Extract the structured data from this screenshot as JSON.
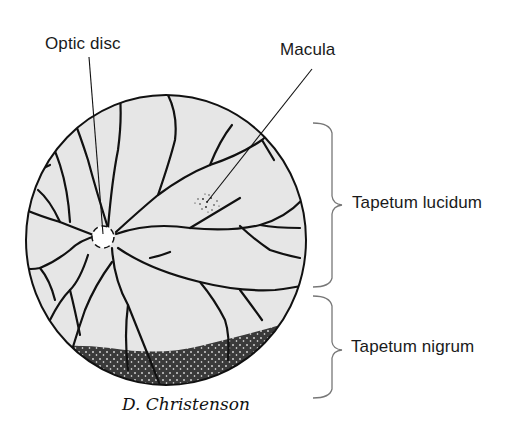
{
  "figure": {
    "labels": {
      "optic_disc": "Optic disc",
      "macula": "Macula",
      "tapetum_lucidum": "Tapetum lucidum",
      "tapetum_nigrum": "Tapetum nigrum"
    },
    "signature": "D. Christenson",
    "colors": {
      "fundus_fill": "#e6e6e6",
      "vessel": "#111111",
      "outline": "#111111",
      "brace": "#777777",
      "nigrum": "#3a3a3a",
      "text": "#1a1a1a"
    }
  }
}
